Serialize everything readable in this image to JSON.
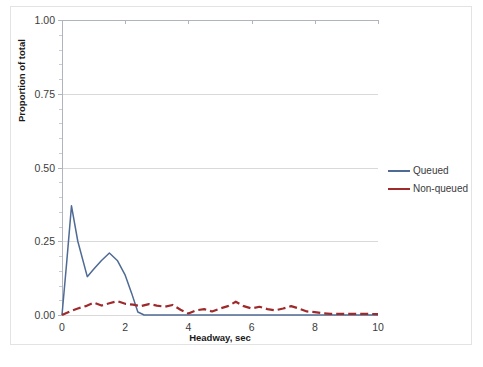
{
  "chart_data": {
    "type": "line",
    "title": "",
    "xlabel": "Headway, sec",
    "ylabel": "Proportion of total",
    "xlim": [
      0,
      10
    ],
    "ylim": [
      0,
      1.0
    ],
    "xticks": [
      0,
      2,
      4,
      6,
      8,
      10
    ],
    "yticks": [
      0.0,
      0.25,
      0.5,
      0.75,
      1.0
    ],
    "ytick_labels": [
      "0.00",
      "0.25",
      "0.50",
      "0.75",
      "1.00"
    ],
    "xtick_labels": [
      "0",
      "2",
      "4",
      "6",
      "8",
      "10"
    ],
    "grid": "horizontal",
    "legend_position": "right",
    "series": [
      {
        "name": "Queued",
        "color": "#4f6a94",
        "style": "solid",
        "x": [
          0.0,
          0.15,
          0.3,
          0.5,
          0.8,
          1.0,
          1.25,
          1.5,
          1.75,
          2.0,
          2.2,
          2.4,
          2.6,
          3.0,
          3.5,
          4.0,
          4.5,
          5.0,
          5.5,
          6.0,
          6.5,
          7.0,
          7.5,
          8.0,
          8.5,
          9.0,
          9.5,
          10.0
        ],
        "values": [
          0.0,
          0.18,
          0.37,
          0.25,
          0.13,
          0.155,
          0.185,
          0.21,
          0.185,
          0.135,
          0.075,
          0.01,
          0.0,
          0.0,
          0.0,
          0.0,
          0.0,
          0.0,
          0.0,
          0.0,
          0.0,
          0.0,
          0.0,
          0.0,
          0.0,
          0.0,
          0.0,
          0.0
        ]
      },
      {
        "name": "Non-queued",
        "color": "#9e2a2b",
        "style": "dashed",
        "x": [
          0.0,
          0.25,
          0.5,
          0.75,
          1.0,
          1.25,
          1.5,
          1.75,
          2.0,
          2.25,
          2.5,
          2.75,
          3.0,
          3.25,
          3.5,
          3.75,
          4.0,
          4.25,
          4.5,
          4.75,
          5.0,
          5.25,
          5.5,
          5.75,
          6.0,
          6.25,
          6.5,
          6.75,
          7.0,
          7.25,
          7.5,
          7.75,
          8.0,
          8.25,
          8.5,
          9.0,
          9.5,
          10.0
        ],
        "values": [
          0.0,
          0.012,
          0.022,
          0.03,
          0.042,
          0.032,
          0.04,
          0.047,
          0.038,
          0.035,
          0.03,
          0.037,
          0.032,
          0.028,
          0.034,
          0.018,
          0.005,
          0.016,
          0.02,
          0.012,
          0.022,
          0.03,
          0.045,
          0.03,
          0.022,
          0.028,
          0.02,
          0.016,
          0.022,
          0.03,
          0.022,
          0.012,
          0.01,
          0.006,
          0.004,
          0.004,
          0.004,
          0.003
        ]
      }
    ]
  },
  "legend": {
    "items": [
      {
        "label": "Queued",
        "color": "#4f6a94"
      },
      {
        "label": "Non-queued",
        "color": "#9e2a2b"
      }
    ]
  },
  "colors": {
    "queued": "#4f6a94",
    "non_queued": "#9e2a2b",
    "gridline": "#d9d9d9",
    "axis": "#b0b4bd",
    "text": "#3b3b3b"
  }
}
